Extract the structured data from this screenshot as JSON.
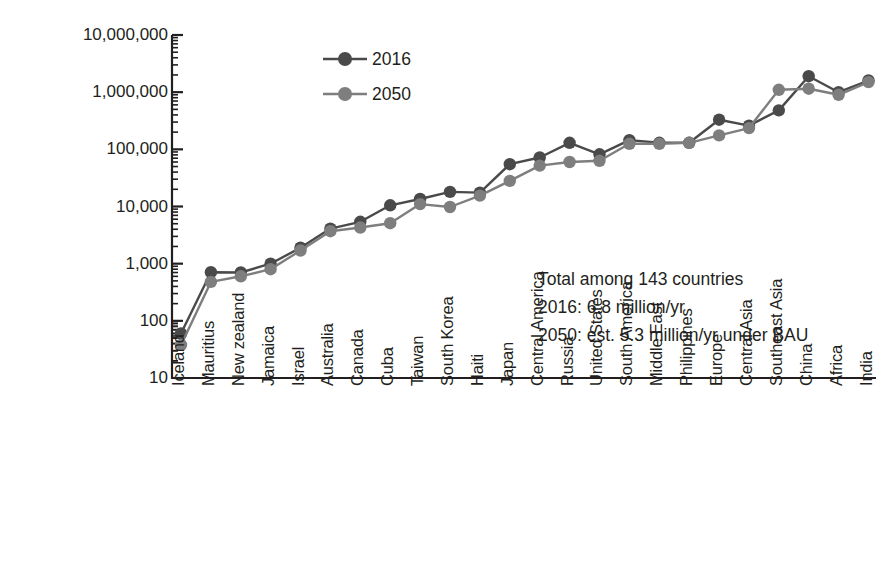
{
  "chart_data": {
    "type": "line",
    "title": "",
    "xlabel": "",
    "ylabel": "Air pollution mortalities per year",
    "yscale": "log",
    "ylim": [
      10,
      10000000
    ],
    "grid": false,
    "legend_position": "upper-left-inside",
    "ytick_labels": [
      "10,000,000",
      "1,000,000",
      "100,000",
      "10,000",
      "1,000",
      "100",
      "10"
    ],
    "ytick_values": [
      10000000,
      1000000,
      100000,
      10000,
      1000,
      100,
      10
    ],
    "categories": [
      "Iceland",
      "Mauritius",
      "New zealand",
      "Jamaica",
      "Israel",
      "Australia",
      "Canada",
      "Cuba",
      "Taiwan",
      "South Korea",
      "Haiti",
      "Japan",
      "Central America",
      "Russia",
      "United States",
      "South America",
      "Middle East",
      "Philippines",
      "Europe",
      "Central Asia",
      "Southeast Asia",
      "China",
      "Africa",
      "India"
    ],
    "series": [
      {
        "name": "2016",
        "color": "#4a4a4a",
        "values": [
          60,
          710,
          700,
          1000,
          1900,
          4100,
          5400,
          10500,
          13500,
          18000,
          17500,
          55000,
          72000,
          130000,
          82000,
          145000,
          130000,
          130000,
          330000,
          260000,
          480000,
          1900000,
          1000000,
          1600000
        ]
      },
      {
        "name": "2050",
        "color": "#7e7e7e",
        "values": [
          38,
          480,
          600,
          800,
          1700,
          3700,
          4300,
          5100,
          11000,
          9800,
          15500,
          28000,
          52000,
          60000,
          63000,
          125000,
          125000,
          130000,
          175000,
          235000,
          1100000,
          1150000,
          900000,
          1500000
        ]
      }
    ],
    "annotations": [
      "Total among 143 countries",
      "2016: 6.8 million/yr",
      "2050: est. 5.3 million/yr under BAU"
    ]
  },
  "legend": {
    "items": [
      {
        "label": "2016",
        "color": "#4a4a4a"
      },
      {
        "label": "2050",
        "color": "#7e7e7e"
      }
    ]
  },
  "colors": {
    "axis": "#231f20",
    "series_2016": "#4a4a4a",
    "series_2050": "#7e7e7e",
    "background": "#ffffff"
  }
}
